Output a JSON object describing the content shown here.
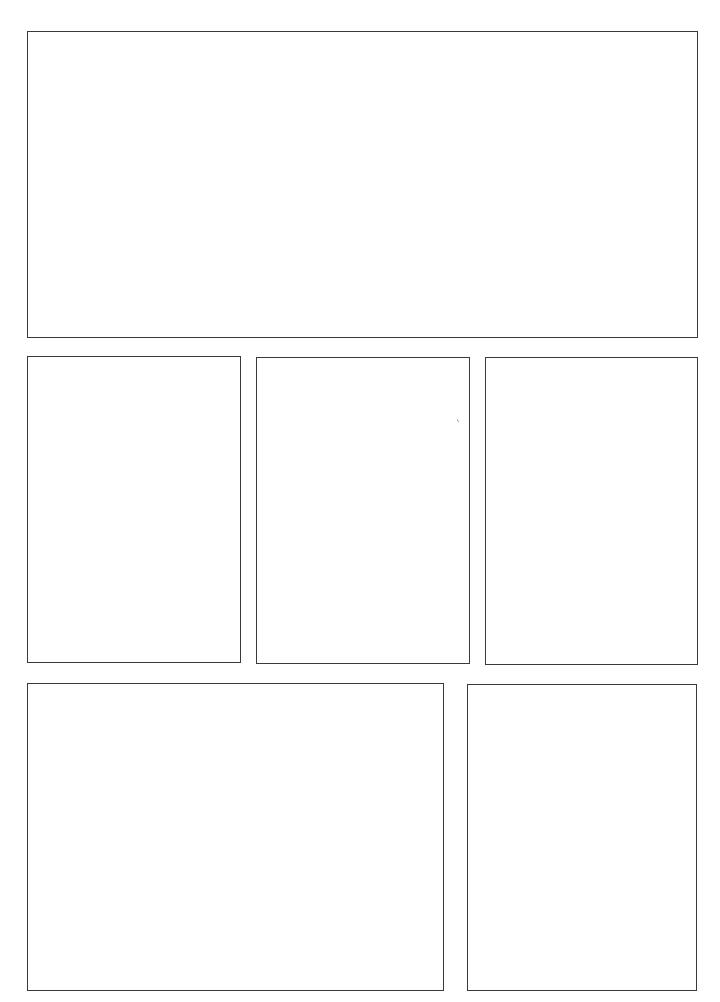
{
  "page": {
    "type": "comic-panel-template",
    "background": "#ffffff",
    "border_color": "#3a3a3a",
    "panels": [
      {
        "id": "panel-1",
        "row": 1,
        "x": 27,
        "y": 31,
        "w": 671,
        "h": 307
      },
      {
        "id": "panel-2",
        "row": 2,
        "x": 27,
        "y": 356,
        "w": 214,
        "h": 307
      },
      {
        "id": "panel-3",
        "row": 2,
        "x": 256,
        "y": 357,
        "w": 214,
        "h": 307
      },
      {
        "id": "panel-4",
        "row": 2,
        "x": 485,
        "y": 357,
        "w": 213,
        "h": 308
      },
      {
        "id": "panel-5",
        "row": 3,
        "x": 27,
        "y": 683,
        "w": 417,
        "h": 308
      },
      {
        "id": "panel-6",
        "row": 3,
        "x": 467,
        "y": 684,
        "w": 230,
        "h": 307
      }
    ]
  }
}
